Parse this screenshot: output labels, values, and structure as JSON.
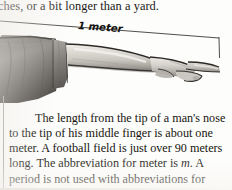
{
  "page": {
    "kind": "scanned-textbook-page-fragment",
    "background_color": "#fdfdfc",
    "text_color": "#1c1a18"
  },
  "top_text": {
    "clipped_line": "ches, or a bit longer than a yard."
  },
  "figure": {
    "caption_label": "1 meter",
    "alt": "grayscale photograph of an outstretched arm in a dark sleeve, palm down, fingers extended to the right",
    "measurement_line": {
      "start_x": 0,
      "start_y": 21,
      "end_x": 219,
      "end_y": 38,
      "tick_height": 20,
      "stroke_color": "#3d3a36"
    },
    "colors": {
      "sleeve_dark": "#5d5a57",
      "sleeve_mid": "#7e7b77",
      "sleeve_light": "#969390",
      "skin_light": "#e7e4df",
      "skin_mid": "#c9c5bf",
      "skin_shadow": "#8e8a84",
      "outline": "#2e2b28"
    }
  },
  "body": {
    "indent_text": "",
    "paragraph_part1": "The length from the tip of a man's nose to the tip of his middle finger is about one meter. A football field is just over 90 meters long. The abbreviation for meter is ",
    "abbreviation": "m",
    "paragraph_part2": ". A period is not used with abbreviations for metric units."
  }
}
